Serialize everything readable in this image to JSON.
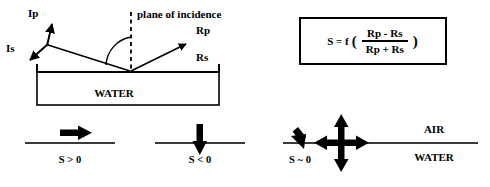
{
  "diagram": {
    "title_text": "polarized reflection at water surface",
    "colors": {
      "ink": "#000000",
      "background": "#ffffff",
      "line_gray": "#3a3a3a"
    },
    "top_left": {
      "label_ip": "Ip",
      "label_is": "Is",
      "label_plane_of_incidence": "plane of incidence",
      "label_rp": "Rp",
      "label_rs": "Rs",
      "label_water": "WATER",
      "incident_arrow_name": "incident-ray",
      "reflected_arrow_name": "reflected-ray",
      "angle_arc_name": "angle-of-incidence-arc",
      "normal_line_name": "plane-of-incidence-dashed-line"
    },
    "equation_box": {
      "lhs": "S = f",
      "open_paren": "(",
      "numerator": "Rp - Rs",
      "denominator": "Rp + Rs",
      "close_paren": ")"
    },
    "bottom_cases": [
      {
        "label": "S > 0",
        "arrow": "right-arrow",
        "name": "case-s-positive"
      },
      {
        "label": "S < 0",
        "arrow": "down-arrow",
        "name": "case-s-negative"
      },
      {
        "label": "S ~ 0",
        "arrow": "four-way-cross-arrows",
        "name": "case-s-zero"
      }
    ],
    "bottom_right": {
      "label_air": "AIR",
      "label_water": "WATER",
      "interface_line_name": "air-water-interface-line",
      "oblique_arrow_name": "oblique-incident-arrow"
    }
  }
}
